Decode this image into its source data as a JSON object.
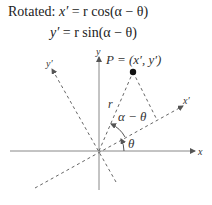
{
  "equations": {
    "prefix": "Rotated:",
    "line1_lhs": "x′",
    "line1_rhs": "= r cos(α − θ)",
    "line2_lhs": "y′",
    "line2_rhs": "= r sin(α − θ)"
  },
  "diagram": {
    "point_label": "P = (x′, y′)",
    "axis_x": "x",
    "axis_y": "y",
    "axis_x_rot": "x′",
    "axis_y_rot": "y′",
    "radius_label": "r",
    "angle_diff_label": "α − θ",
    "angle_theta_label": "θ"
  }
}
